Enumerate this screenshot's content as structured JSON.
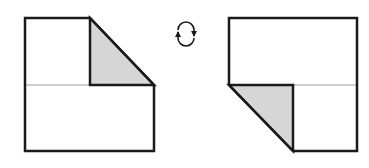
{
  "diagram": {
    "colors": {
      "outline": "#1a1a1a",
      "fold_line": "#9a9a9a",
      "shaded_flap": "#d6d6d6",
      "background": "#ffffff"
    },
    "left_figure": {
      "label": "before",
      "outer_outline": [
        [
          25,
          18
        ],
        [
          90,
          18
        ],
        [
          154,
          85
        ],
        [
          154,
          151
        ],
        [
          25,
          151
        ]
      ],
      "flap_triangle": [
        [
          90,
          18
        ],
        [
          154,
          85
        ],
        [
          90,
          85
        ]
      ],
      "fold_line_y": 85
    },
    "turn_over_symbol": {
      "icon": "rotate-turn-over-icon",
      "center": [
        186,
        34
      ]
    },
    "right_figure": {
      "label": "after",
      "outer_outline": [
        [
          229,
          18
        ],
        [
          357,
          18
        ],
        [
          357,
          151
        ],
        [
          293,
          151
        ],
        [
          229,
          85
        ]
      ],
      "flap_triangle": [
        [
          229,
          85
        ],
        [
          293,
          85
        ],
        [
          293,
          151
        ]
      ],
      "fold_line_y": 85
    }
  }
}
